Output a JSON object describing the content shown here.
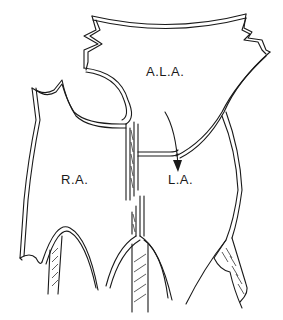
{
  "diagram": {
    "type": "anatomical line drawing",
    "labels": {
      "accessory_left_atrium": "A.L.A.",
      "right_atrium": "R.A.",
      "left_atrium": "L.A."
    },
    "arrow": {
      "from": "A.L.A.",
      "to": "L.A."
    },
    "colors": {
      "line": "#1a1a1a",
      "background": "#ffffff"
    }
  }
}
